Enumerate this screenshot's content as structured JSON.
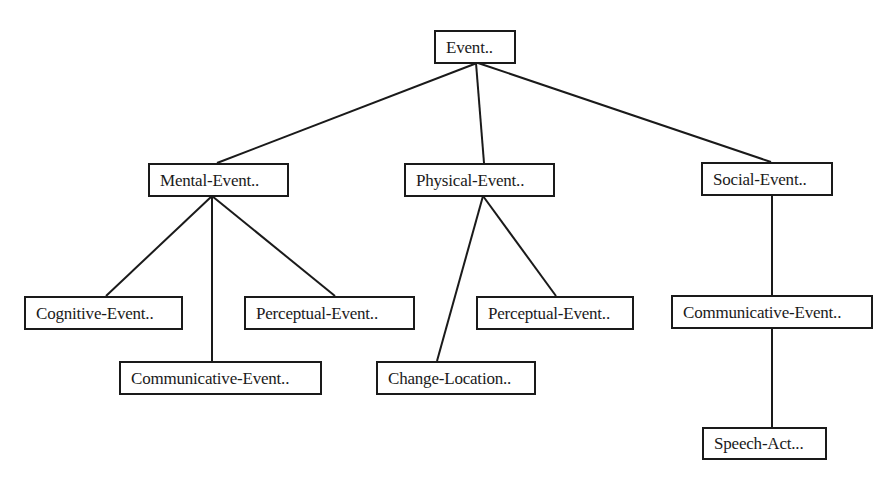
{
  "diagram": {
    "type": "tree",
    "line_color": "#1a1a1a",
    "box_border_color": "#1a1a1a",
    "background": "#ffffff",
    "nodes": [
      {
        "id": "event",
        "label": "Event..",
        "x": 434,
        "y": 30,
        "w": 82,
        "h": 34
      },
      {
        "id": "mental",
        "label": "Mental-Event..",
        "x": 148,
        "y": 163,
        "w": 141,
        "h": 34
      },
      {
        "id": "physical",
        "label": "Physical-Event..",
        "x": 404,
        "y": 163,
        "w": 151,
        "h": 34
      },
      {
        "id": "social",
        "label": "Social-Event..",
        "x": 701,
        "y": 162,
        "w": 132,
        "h": 34
      },
      {
        "id": "cognitive",
        "label": "Cognitive-Event..",
        "x": 24,
        "y": 296,
        "w": 159,
        "h": 34
      },
      {
        "id": "perceptual_mental",
        "label": "Perceptual-Event..",
        "x": 244,
        "y": 296,
        "w": 171,
        "h": 34
      },
      {
        "id": "communicative_mental",
        "label": "Communicative-Event..",
        "x": 119,
        "y": 361,
        "w": 203,
        "h": 34
      },
      {
        "id": "change_location",
        "label": "Change-Location..",
        "x": 376,
        "y": 361,
        "w": 160,
        "h": 34
      },
      {
        "id": "perceptual_physical",
        "label": "Perceptual-Event..",
        "x": 476,
        "y": 296,
        "w": 158,
        "h": 34
      },
      {
        "id": "communicative_social",
        "label": "Communicative-Event..",
        "x": 671,
        "y": 295,
        "w": 202,
        "h": 34
      },
      {
        "id": "speech_act",
        "label": "Speech-Act...",
        "x": 702,
        "y": 427,
        "w": 125,
        "h": 33
      }
    ],
    "edges": [
      {
        "from": "event",
        "to": "mental",
        "x1": 477,
        "y1": 63,
        "x2": 217,
        "y2": 163
      },
      {
        "from": "event",
        "to": "physical",
        "x1": 476,
        "y1": 63,
        "x2": 484,
        "y2": 163
      },
      {
        "from": "event",
        "to": "social",
        "x1": 478,
        "y1": 63,
        "x2": 771,
        "y2": 162
      },
      {
        "from": "mental",
        "to": "cognitive",
        "x1": 212,
        "y1": 196,
        "x2": 106,
        "y2": 296
      },
      {
        "from": "mental",
        "to": "communicative_mental",
        "x1": 212,
        "y1": 196,
        "x2": 212,
        "y2": 361
      },
      {
        "from": "mental",
        "to": "perceptual_mental",
        "x1": 212,
        "y1": 196,
        "x2": 335,
        "y2": 296
      },
      {
        "from": "physical",
        "to": "change_location",
        "x1": 483,
        "y1": 196,
        "x2": 437,
        "y2": 361
      },
      {
        "from": "physical",
        "to": "perceptual_physical",
        "x1": 483,
        "y1": 196,
        "x2": 556,
        "y2": 296
      },
      {
        "from": "social",
        "to": "communicative_social",
        "x1": 772,
        "y1": 195,
        "x2": 772,
        "y2": 295
      },
      {
        "from": "communicative_social",
        "to": "speech_act",
        "x1": 772,
        "y1": 328,
        "x2": 772,
        "y2": 427
      }
    ]
  }
}
